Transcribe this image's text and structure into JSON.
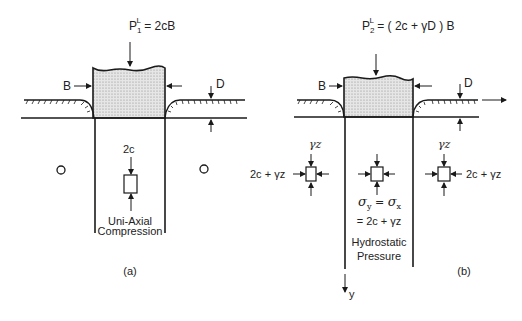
{
  "panel_a": {
    "load_label_main": "P",
    "load_label_sub": "1",
    "load_label_sup": "L",
    "load_label_rhs": " = 2cB",
    "width_label": "B",
    "depth_label": "D",
    "stress_top_label": "2c",
    "zone_label_line1": "Uni-Axial",
    "zone_label_line2": "Compression",
    "caption": "(a)"
  },
  "panel_b": {
    "load_label_main": "P",
    "load_label_sub": "2",
    "load_label_sup": "L",
    "load_label_rhs": " = ( 2c + γD ) B",
    "width_label": "B",
    "depth_label": "D",
    "left_element_top": "γz",
    "left_element_side": "2c + γz",
    "right_element_top": "γz",
    "right_element_side": "2c + γz",
    "center_eq_line1_a": "σ",
    "center_eq_line1_a_sub": "y",
    "center_eq_line1_eq": " = ",
    "center_eq_line1_b": "σ",
    "center_eq_line1_b_sub": "x",
    "center_eq_line2": "= 2c + γz",
    "zone_label_line1": "Hydrostatic",
    "zone_label_line2": "Pressure",
    "axis_label": "y",
    "caption": "(b)"
  },
  "colors": {
    "ink": "#1a1a1a",
    "fill_stipple": "#d9d9d9"
  }
}
